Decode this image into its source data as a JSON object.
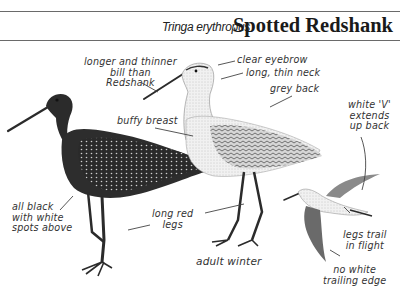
{
  "header": {
    "scientific_name": "Tringa erythropus",
    "common_name": "Spotted Redshank"
  },
  "figures": [
    {
      "name": "summer-adult",
      "description": "dark bird, all black with white spots"
    },
    {
      "name": "adult-winter",
      "caption": "adult winter"
    },
    {
      "name": "flight",
      "description": "bird in flight"
    }
  ],
  "labels": {
    "bill": [
      "longer and thinner",
      "bill than",
      "Redshank"
    ],
    "eyebrow": "clear eyebrow",
    "neck": "long, thin neck",
    "back": "grey back",
    "breast": "buffy breast",
    "white_v": [
      "white 'V'",
      "extends",
      "up back"
    ],
    "black": [
      "all black",
      "with white",
      "spots above"
    ],
    "legs": [
      "long red",
      "legs"
    ],
    "winter": "adult winter",
    "legs_trail": [
      "legs trail",
      "in flight"
    ],
    "trailing_edge": [
      "no white",
      "trailing edge"
    ]
  },
  "colors": {
    "ink": "#1a1a1a",
    "rule": "#6a6a6a",
    "dark_bird": "#2b2b2b",
    "pale_bird": "#e6e6e6"
  }
}
